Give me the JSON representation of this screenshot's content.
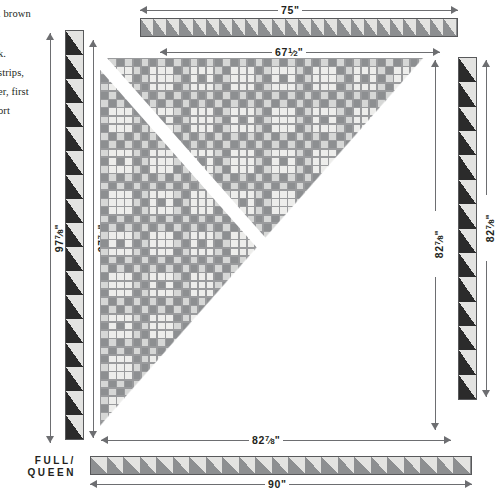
{
  "document": {
    "kind": "quilt-assembly-diagram",
    "size_label": "FULL/\nQUEEN",
    "size_label_line1": "FULL/",
    "size_label_line2": "QUEEN"
  },
  "body_text": {
    "lines": [
      ". brown",
      "k.",
      "strips,",
      "er, first",
      "ort"
    ]
  },
  "measurements": {
    "top_outer": {
      "value": "75",
      "unit": "\"",
      "whole": "75",
      "num": "",
      "den": ""
    },
    "top_inner": {
      "whole": "67",
      "num": "1",
      "den": "2",
      "unit": "\""
    },
    "bottom_inner": {
      "whole": "82",
      "num": "7",
      "den": "8",
      "unit": "\""
    },
    "bottom_outer": {
      "value": "90",
      "unit": "\"",
      "whole": "90",
      "num": "",
      "den": ""
    },
    "left_outer": {
      "whole": "97",
      "num": "7",
      "den": "8",
      "unit": "\""
    },
    "left_inner": {
      "whole": "97",
      "num": "7",
      "den": "8",
      "unit": "\""
    },
    "right_inner": {
      "whole": "82",
      "num": "7",
      "den": "8",
      "unit": "\""
    },
    "right_outer": {
      "whole": "82",
      "num": "7",
      "den": "8",
      "unit": "\""
    }
  },
  "colors": {
    "dark": "#2b2b2b",
    "medium_gray": "#8d8f91",
    "light_gray": "#d6d7d6",
    "pale": "#e8e8e6",
    "background_cream": "#ededeb",
    "outline": "#9a9b9d",
    "rule": "#6d6e71",
    "ink": "#231f20",
    "white": "#ffffff"
  },
  "quilt": {
    "block_rows": 9,
    "block_cols": 8,
    "block_style": "irish-chain-nine-patch",
    "fold_line": "white diagonal from upper-left to lower-right"
  },
  "borders": {
    "top_strip": {
      "teeth": 24,
      "bg": "#8d8f91",
      "tri": "#e3e3e1",
      "name": "sawtooth-border-top"
    },
    "bottom_strip": {
      "teeth": 23,
      "bg": "#8d8f91",
      "tri": "#e3e3e1",
      "name": "sawtooth-border-bottom"
    },
    "left_strip": {
      "teeth": 17,
      "bg": "#2b2b2b",
      "tri": "#e3e3e1",
      "name": "sawtooth-border-left"
    },
    "right_strip": {
      "teeth": 14,
      "bg": "#2b2b2b",
      "tri": "#e3e3e1",
      "name": "sawtooth-border-right"
    }
  }
}
